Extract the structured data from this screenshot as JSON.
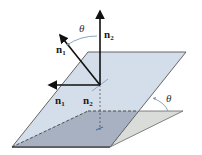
{
  "diagram": {
    "labels": {
      "n1_tilted": "n",
      "n1_tilted_sub": "1",
      "n2_vertical": "n",
      "n2_vertical_sub": "2",
      "n1_projected": "n",
      "n1_projected_sub": "1",
      "n2_projected": "n",
      "n2_projected_sub": "2",
      "theta_normals": "θ",
      "theta_planes": "θ"
    },
    "colors": {
      "upper_plane_fill": "#cdd8e6",
      "lower_plane_fill": "#9aa3b2",
      "wedge_fill": "#d9dcd8",
      "edge": "#555555",
      "vector": "#111111",
      "arc": "#6b8fb0",
      "dashed": "#444444"
    }
  }
}
